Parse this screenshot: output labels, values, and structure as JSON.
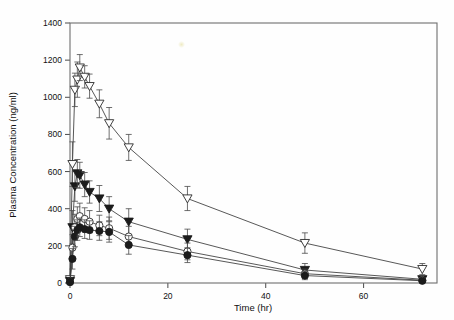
{
  "chart_data": {
    "type": "line",
    "title": "",
    "xlabel": "Time (hr)",
    "ylabel": "Plasma Concentration (ng/ml)",
    "xlim": [
      0,
      75
    ],
    "ylim": [
      0,
      1400
    ],
    "xticks": [
      0,
      20,
      40,
      60
    ],
    "yticks": [
      0,
      200,
      400,
      600,
      800,
      1000,
      1200,
      1400
    ],
    "grid": false,
    "legend": "none",
    "error_bars": "standard deviation",
    "x": [
      0,
      0.5,
      1,
      1.5,
      2,
      3,
      4,
      6,
      8,
      12,
      24,
      48,
      72
    ],
    "series": [
      {
        "name": "open-triangle-series",
        "marker": "open-triangle-down",
        "values": [
          20,
          640,
          1040,
          1095,
          1160,
          1110,
          1060,
          965,
          860,
          730,
          455,
          215,
          75
        ],
        "errors": [
          15,
          120,
          90,
          95,
          70,
          60,
          65,
          75,
          85,
          70,
          65,
          55,
          30
        ]
      },
      {
        "name": "filled-triangle-series",
        "marker": "filled-triangle-down",
        "values": [
          10,
          300,
          520,
          590,
          580,
          530,
          490,
          455,
          400,
          330,
          235,
          70,
          20
        ],
        "errors": [
          10,
          90,
          80,
          75,
          70,
          65,
          60,
          70,
          65,
          70,
          55,
          35,
          12
        ]
      },
      {
        "name": "open-circle-series",
        "marker": "open-circle",
        "values": [
          5,
          190,
          300,
          345,
          360,
          345,
          330,
          310,
          295,
          250,
          170,
          50,
          15
        ],
        "errors": [
          8,
          70,
          70,
          65,
          70,
          60,
          60,
          55,
          60,
          55,
          45,
          25,
          10
        ]
      },
      {
        "name": "filled-circle-series",
        "marker": "filled-circle",
        "values": [
          5,
          130,
          250,
          285,
          300,
          290,
          285,
          280,
          275,
          205,
          150,
          40,
          12
        ],
        "errors": [
          8,
          55,
          55,
          55,
          50,
          50,
          50,
          50,
          55,
          50,
          40,
          22,
          8
        ]
      }
    ],
    "colors": {
      "line": "#3a3a3a",
      "marker_fill": "#1b1b1b",
      "marker_open": "#ffffff",
      "axis": "#6e6e6e"
    }
  },
  "axis": {
    "x_title": "Time (hr)",
    "y_title": "Plasma Concentration (ng/ml)",
    "x_ticks": [
      "0",
      "20",
      "40",
      "60"
    ],
    "y_ticks": [
      "0",
      "200",
      "400",
      "600",
      "800",
      "1000",
      "1200",
      "1400"
    ]
  }
}
